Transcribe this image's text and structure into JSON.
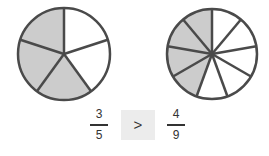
{
  "left_pie": {
    "divisions": 5,
    "shaded": 3,
    "shade_color": "#cccccc",
    "stroke_color": "#4a4a4a"
  },
  "right_pie": {
    "divisions": 9,
    "shaded": 4,
    "shade_color": "#cccccc",
    "stroke_color": "#4a4a4a"
  },
  "left_fraction": {
    "numerator": "3",
    "denominator": "5"
  },
  "comparison": {
    "symbol": ">"
  },
  "right_fraction": {
    "numerator": "4",
    "denominator": "9"
  }
}
